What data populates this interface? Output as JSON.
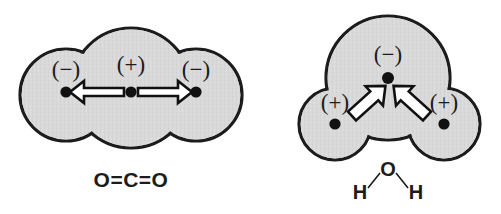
{
  "figure": {
    "background_color": "#ffffff",
    "lobe_fill_color": "#d9d9d9",
    "lobe_stroke_color": "#1c1c1c",
    "atom_dot_color": "#111111",
    "arrow_fill_color": "#ffffff",
    "arrow_stroke_color": "#111111",
    "text_color": "#1c1c1c"
  },
  "molecules": [
    {
      "id": "carbon-dioxide",
      "formula_label": "O=C=O",
      "shape": "linear",
      "atoms": [
        {
          "id": "o-left",
          "element": "O",
          "charge_label": "(−)",
          "cx": 66,
          "cy": 95,
          "lobe_r": 46
        },
        {
          "id": "c-center",
          "element": "C",
          "charge_label": "(+)",
          "cx": 131,
          "cy": 88,
          "lobe_r": 60
        },
        {
          "id": "o-right",
          "element": "O",
          "charge_label": "(−)",
          "cx": 196,
          "cy": 95,
          "lobe_r": 46
        }
      ],
      "dipole_arrows": [
        {
          "id": "arrow-center-to-left",
          "from": "c-center",
          "to": "o-left",
          "direction": "left"
        },
        {
          "id": "arrow-center-to-right",
          "from": "c-center",
          "to": "o-right",
          "direction": "right"
        }
      ],
      "net_dipole": "cancelled"
    },
    {
      "id": "water",
      "formula_label": "H O H",
      "formula_parts": {
        "oxygen": "O",
        "hydrogen_left": "H",
        "hydrogen_right": "H"
      },
      "shape": "bent",
      "atoms": [
        {
          "id": "o-top",
          "element": "O",
          "charge_label": "(−)",
          "cx": 388,
          "cy": 78,
          "lobe_r": 62
        },
        {
          "id": "h-left",
          "element": "H",
          "charge_label": "(+)",
          "cx": 335,
          "cy": 124,
          "lobe_r": 36
        },
        {
          "id": "h-right",
          "element": "H",
          "charge_label": "(+)",
          "cx": 444,
          "cy": 124,
          "lobe_r": 36
        }
      ],
      "dipole_arrows": [
        {
          "id": "arrow-hleft-to-o",
          "from": "h-left",
          "to": "o-top",
          "direction": "up-right"
        },
        {
          "id": "arrow-hright-to-o",
          "from": "h-right",
          "to": "o-top",
          "direction": "up-left"
        }
      ],
      "net_dipole": "nonzero"
    }
  ]
}
